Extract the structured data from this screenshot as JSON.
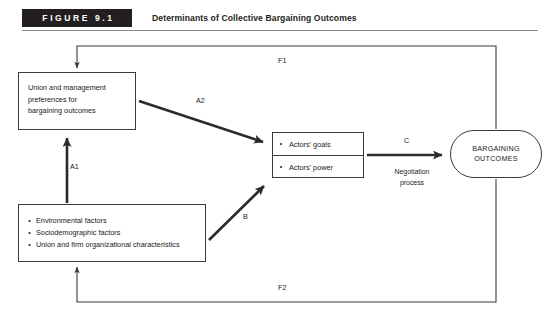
{
  "figure": {
    "badge": "FIGURE 9.1",
    "title": "Determinants of Collective Bargaining Outcomes"
  },
  "nodes": {
    "preferences": {
      "name": "Union and management preferences for bargaining outcomes",
      "lines": [
        "Union and management",
        "preferences for",
        "bargaining outcomes"
      ]
    },
    "factors": {
      "name": "Input factors",
      "bullets": [
        "Environmental factors",
        "Sociodemographic factors",
        "Union and firm organizational characteristics"
      ],
      "bullet_glyph": "•"
    },
    "actors": {
      "name": "Actors",
      "cells": [
        "Actors' goals",
        "Actors' power"
      ],
      "bullet_glyph": "•"
    },
    "outcomes": {
      "name": "Bargaining outcomes",
      "lines": [
        "BARGAINING",
        "OUTCOMES"
      ]
    }
  },
  "edges": {
    "A1": "A1",
    "A2": "A2",
    "B": "B",
    "C": "C",
    "F1": "F1",
    "F2": "F2",
    "negotiation_line1": "Negotiation",
    "negotiation_line2": "process"
  },
  "colors": {
    "ink": "#1a1a1a",
    "stroke": "#3b3b3b",
    "badge_bg": "#231f20",
    "badge_fg": "#ffffff",
    "rule": "#8a8a8a",
    "page_bg": "#ffffff"
  }
}
